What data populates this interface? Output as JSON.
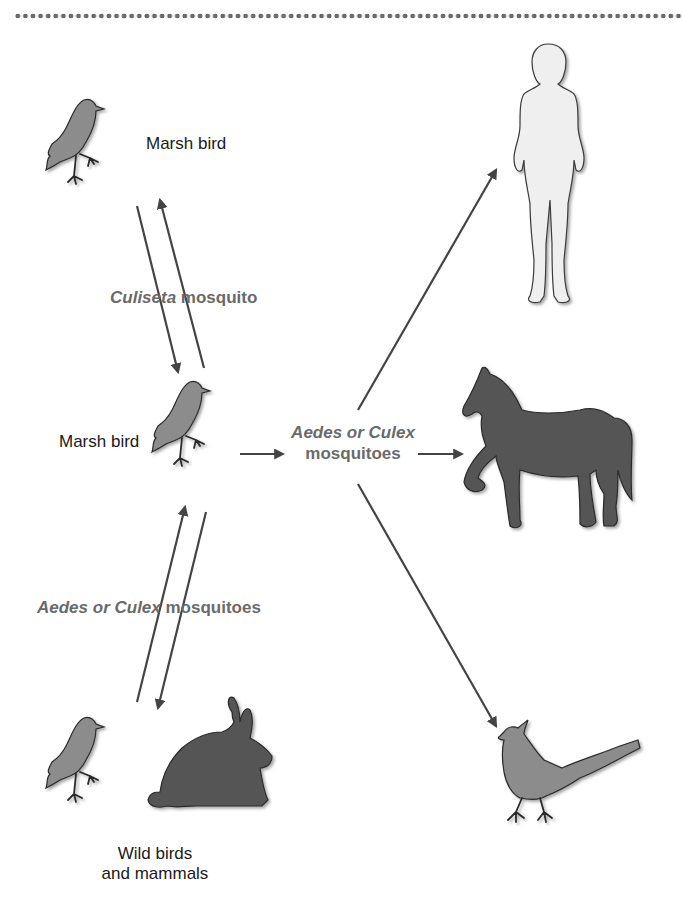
{
  "diagram": {
    "title": "",
    "colors": {
      "arrow": "#444444",
      "vector_text": "#6a6a6a",
      "bird_fill": "#8c8c8c",
      "mammal_fill": "#555555",
      "human_fill": "#efefef"
    },
    "nodes": {
      "marsh_bird_top": {
        "label": "Marsh bird",
        "icon": "bird-icon"
      },
      "marsh_bird_center": {
        "label": "Marsh bird",
        "icon": "bird-icon"
      },
      "wild_hosts": {
        "label_line1": "Wild birds",
        "label_line2": "and mammals",
        "icons": [
          "bird-icon",
          "rabbit-icon"
        ]
      },
      "human": {
        "icon": "human-icon"
      },
      "horse": {
        "icon": "horse-icon"
      },
      "bird_dead_end": {
        "icon": "crested-bird-icon"
      }
    },
    "vectors": {
      "top_cycle": {
        "genus": "Culiseta",
        "suffix": " mosquito"
      },
      "bottom_cycle": {
        "genus": "Aedes or Culex",
        "suffix": " mosquitoes"
      },
      "spillover": {
        "line1": "Aedes or Culex",
        "line2": "mosquitoes"
      }
    },
    "edges": [
      {
        "from": "marsh_bird_top",
        "to": "marsh_bird_center",
        "via": "Culiseta mosquito"
      },
      {
        "from": "marsh_bird_center",
        "to": "marsh_bird_top",
        "via": "Culiseta mosquito"
      },
      {
        "from": "wild_hosts",
        "to": "marsh_bird_center",
        "via": "Aedes or Culex mosquitoes"
      },
      {
        "from": "marsh_bird_center",
        "to": "wild_hosts",
        "via": "Aedes or Culex mosquitoes"
      },
      {
        "from": "marsh_bird_center",
        "to": "human",
        "via": "Aedes or Culex mosquitoes"
      },
      {
        "from": "marsh_bird_center",
        "to": "horse",
        "via": "Aedes or Culex mosquitoes"
      },
      {
        "from": "marsh_bird_center",
        "to": "bird_dead_end",
        "via": "Aedes or Culex mosquitoes"
      }
    ]
  }
}
